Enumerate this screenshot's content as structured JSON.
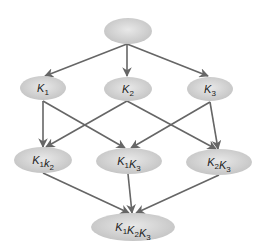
{
  "diagram": {
    "type": "lattice",
    "colors": {
      "node_fill_center": "#e6e6e6",
      "node_fill_edge": "#c4c4c4",
      "edge": "#666666",
      "text": "#222222",
      "background": "#ffffff"
    },
    "nodes": [
      {
        "id": "root",
        "label": "",
        "cx": 128,
        "cy": 31,
        "rx": 24,
        "ry": 13
      },
      {
        "id": "k1",
        "label": "K",
        "subscript": "1",
        "cx": 43,
        "cy": 88,
        "rx": 23,
        "ry": 12
      },
      {
        "id": "k2",
        "label": "K",
        "subscript": "2",
        "cx": 128,
        "cy": 89,
        "rx": 24,
        "ry": 12
      },
      {
        "id": "k3",
        "label": "K",
        "subscript": "3",
        "cx": 210,
        "cy": 89,
        "rx": 23,
        "ry": 12
      },
      {
        "id": "k1k2",
        "parts": [
          {
            "b": "K",
            "s": "1"
          },
          {
            "b": "k",
            "s": "2"
          }
        ],
        "text": "K1k2",
        "cx": 43,
        "cy": 160,
        "rx": 29,
        "ry": 13
      },
      {
        "id": "k1k3",
        "parts": [
          {
            "b": "K",
            "s": "1"
          },
          {
            "b": "K",
            "s": "3"
          }
        ],
        "text": "K1K3",
        "cx": 129,
        "cy": 161,
        "rx": 33,
        "ry": 13
      },
      {
        "id": "k2k3",
        "parts": [
          {
            "b": "K",
            "s": "2"
          },
          {
            "b": "K",
            "s": "3"
          }
        ],
        "text": "K2K3",
        "cx": 219,
        "cy": 162,
        "rx": 33,
        "ry": 13
      },
      {
        "id": "k1k2k3",
        "parts": [
          {
            "b": "K",
            "s": "1"
          },
          {
            "b": "K",
            "s": "2"
          },
          {
            "b": "K",
            "s": "3"
          }
        ],
        "text": "K1K2K3",
        "cx": 133,
        "cy": 227,
        "rx": 42,
        "ry": 14
      }
    ],
    "edges": [
      {
        "from": "root",
        "to": "k1",
        "x1": 127,
        "y1": 44,
        "x2": 45,
        "y2": 76
      },
      {
        "from": "root",
        "to": "k2",
        "x1": 127,
        "y1": 44,
        "x2": 127,
        "y2": 76
      },
      {
        "from": "root",
        "to": "k3",
        "x1": 127,
        "y1": 44,
        "x2": 208,
        "y2": 76
      },
      {
        "from": "k1",
        "to": "k1k2",
        "x1": 43,
        "y1": 101,
        "x2": 43,
        "y2": 147
      },
      {
        "from": "k1",
        "to": "k1k3",
        "x1": 43,
        "y1": 101,
        "x2": 125,
        "y2": 148
      },
      {
        "from": "k2",
        "to": "k1k2",
        "x1": 127,
        "y1": 101,
        "x2": 46,
        "y2": 147
      },
      {
        "from": "k2",
        "to": "k2k3",
        "x1": 127,
        "y1": 101,
        "x2": 216,
        "y2": 149
      },
      {
        "from": "k3",
        "to": "k1k3",
        "x1": 210,
        "y1": 102,
        "x2": 131,
        "y2": 148
      },
      {
        "from": "k3",
        "to": "k2k3",
        "x1": 210,
        "y1": 102,
        "x2": 218,
        "y2": 149
      },
      {
        "from": "k1k2",
        "to": "k1k2k3",
        "x1": 43,
        "y1": 173,
        "x2": 129,
        "y2": 213
      },
      {
        "from": "k1k3",
        "to": "k1k2k3",
        "x1": 128,
        "y1": 174,
        "x2": 132,
        "y2": 213
      },
      {
        "from": "k2k3",
        "to": "k1k2k3",
        "x1": 219,
        "y1": 175,
        "x2": 136,
        "y2": 213
      }
    ]
  }
}
